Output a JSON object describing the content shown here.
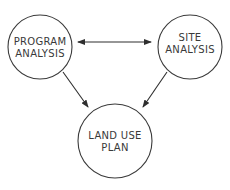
{
  "diagram": {
    "nodes": [
      {
        "id": "program",
        "lines": [
          "PROGRAM",
          "ANALYSIS"
        ],
        "cx": 40,
        "cy": 47,
        "r": 32
      },
      {
        "id": "site",
        "lines": [
          "SITE",
          "ANALYSIS"
        ],
        "cx": 190,
        "cy": 47,
        "r": 32
      },
      {
        "id": "landuse",
        "lines": [
          "LAND USE",
          "PLAN"
        ],
        "cx": 115,
        "cy": 141,
        "r": 37
      }
    ],
    "edges": [
      {
        "from": "program",
        "to": "site",
        "bidirectional": true
      },
      {
        "from": "program",
        "to": "landuse",
        "bidirectional": false
      },
      {
        "from": "site",
        "to": "landuse",
        "bidirectional": false
      }
    ],
    "colors": {
      "stroke": "#3a3a3a",
      "text": "#3a3a3a",
      "background": "#ffffff"
    }
  }
}
